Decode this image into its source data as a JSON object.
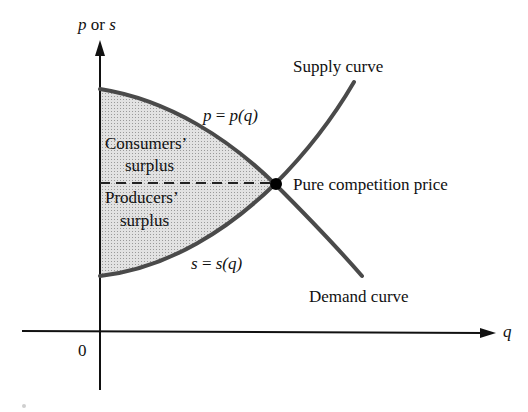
{
  "diagram": {
    "type": "economics-surplus",
    "y_axis_label": {
      "p": "p",
      "or": " or ",
      "s": "s"
    },
    "x_axis_label": "q",
    "origin_label": "0",
    "labels": {
      "supply_curve": "Supply curve",
      "demand_curve": "Demand curve",
      "demand_equation": {
        "lhs": "p",
        "eq": " = ",
        "rhs": "p(q)"
      },
      "supply_equation": {
        "lhs": "s",
        "eq": " = ",
        "rhs": "s(q)"
      },
      "consumers_surplus_line1": "Consumers’",
      "consumers_surplus_line2": "surplus",
      "producers_surplus_line1": "Producers’",
      "producers_surplus_line2": "surplus",
      "equilibrium": "Pure competition price"
    },
    "colors": {
      "curve": "#4a4a4a",
      "axis": "#111111",
      "fill": "#d9d9d9",
      "point": "#000000"
    }
  }
}
